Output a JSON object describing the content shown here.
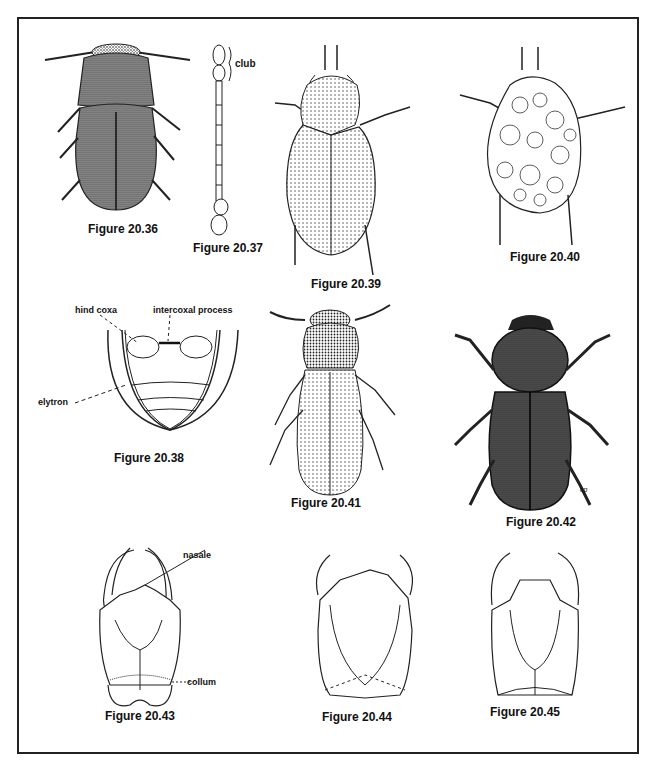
{
  "plate": {
    "figures": [
      {
        "id": "20.36",
        "caption": "Figure 20.36",
        "subject": "stippled oval beetle, dorsal view"
      },
      {
        "id": "20.37",
        "caption": "Figure 20.37",
        "subject": "antenna with club",
        "labels": [
          "club"
        ]
      },
      {
        "id": "20.38",
        "caption": "Figure 20.38",
        "subject": "abdomen ventral view",
        "labels": [
          "hind coxa",
          "intercoxal process",
          "elytron"
        ]
      },
      {
        "id": "20.39",
        "caption": "Figure 20.39",
        "subject": "oval beetle with punctate elytra"
      },
      {
        "id": "20.40",
        "caption": "Figure 20.40",
        "subject": "beetle covered with debris"
      },
      {
        "id": "20.41",
        "caption": "Figure 20.41",
        "subject": "elongate beetle with punctate elytra"
      },
      {
        "id": "20.42",
        "caption": "Figure 20.42",
        "subject": "dark hairy beetle",
        "signature": "cp"
      },
      {
        "id": "20.43",
        "caption": "Figure 20.43",
        "subject": "head capsule",
        "labels": [
          "nasale",
          "collum"
        ]
      },
      {
        "id": "20.44",
        "caption": "Figure 20.44",
        "subject": "head capsule"
      },
      {
        "id": "20.45",
        "caption": "Figure 20.45",
        "subject": "head capsule"
      }
    ],
    "colors": {
      "ink": "#111111",
      "background": "#ffffff",
      "frame": "#222222"
    }
  }
}
